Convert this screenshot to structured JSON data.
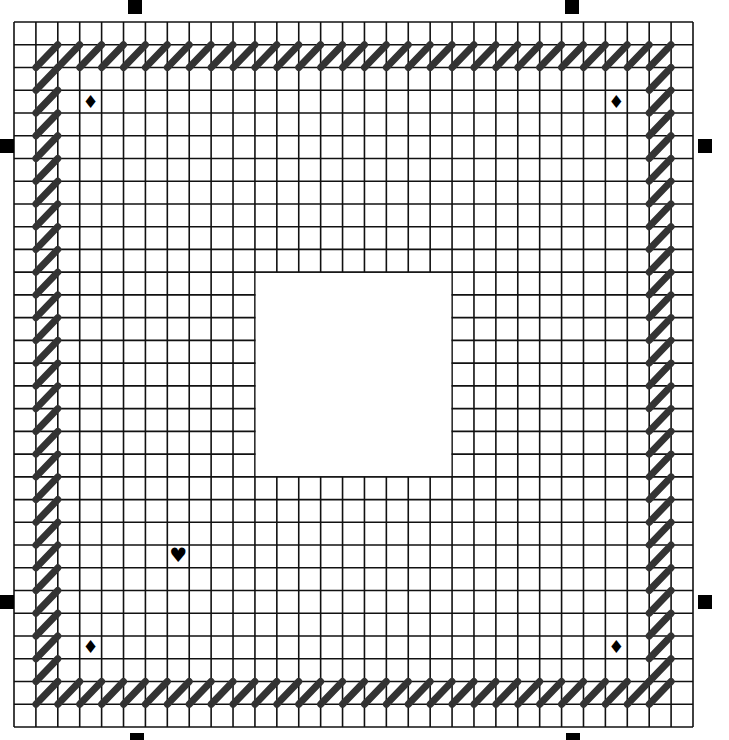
{
  "pattern": {
    "type": "plastic-canvas-chart",
    "grid": {
      "cols": 31,
      "rows": 31,
      "left": 14,
      "top": 22,
      "width": 679,
      "height": 705,
      "line_color": "#111111",
      "line_width": 1.6,
      "background": "#ffffff"
    },
    "cutout": {
      "label": "cut-out center",
      "col_start": 11,
      "col_end": 20,
      "row_start": 11,
      "row_end": 20
    },
    "border_stitch": {
      "style": "slanted-diagonal",
      "direction": "bottom-left-to-top-right",
      "color": "#333333",
      "stroke_width": 7,
      "inset_index": 1,
      "outer_index": 29
    },
    "symbols": [
      {
        "name": "diamond",
        "glyph": "♦",
        "col": 3,
        "row": 3
      },
      {
        "name": "diamond",
        "glyph": "♦",
        "col": 27,
        "row": 3
      },
      {
        "name": "diamond",
        "glyph": "♦",
        "col": 3,
        "row": 27
      },
      {
        "name": "diamond",
        "glyph": "♦",
        "col": 27,
        "row": 27
      },
      {
        "name": "heart",
        "glyph": "♥",
        "col": 7,
        "row": 23
      }
    ],
    "selection_handles": [
      {
        "position": "top-left",
        "x": 128,
        "y": 0
      },
      {
        "position": "top-right",
        "x": 565,
        "y": 0
      },
      {
        "position": "left-top",
        "x": 0,
        "y": 139
      },
      {
        "position": "left-bottom",
        "x": 0,
        "y": 595
      },
      {
        "position": "right-top",
        "x": 698,
        "y": 139
      },
      {
        "position": "right-bottom",
        "x": 698,
        "y": 595
      },
      {
        "position": "bottom-left",
        "x": 130,
        "y": 733
      },
      {
        "position": "bottom-right",
        "x": 566,
        "y": 733
      }
    ]
  }
}
